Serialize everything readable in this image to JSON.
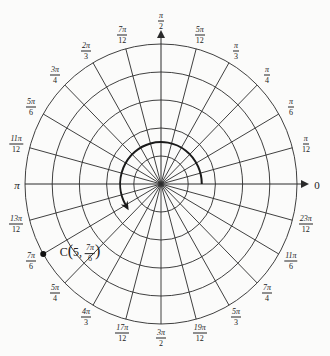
{
  "chart_data": {
    "type": "polar-grid",
    "title": "",
    "radial_circles": [
      1,
      2,
      3,
      4,
      5
    ],
    "angle_step": "π/12",
    "angle_labels": [
      {
        "angle_deg": 0,
        "num": "0",
        "den": ""
      },
      {
        "angle_deg": 15,
        "num": "π",
        "den": "12"
      },
      {
        "angle_deg": 30,
        "num": "π",
        "den": "6"
      },
      {
        "angle_deg": 45,
        "num": "π",
        "den": "4"
      },
      {
        "angle_deg": 60,
        "num": "π",
        "den": "3"
      },
      {
        "angle_deg": 75,
        "num": "5π",
        "den": "12"
      },
      {
        "angle_deg": 90,
        "num": "π",
        "den": "2"
      },
      {
        "angle_deg": 105,
        "num": "7π",
        "den": "12"
      },
      {
        "angle_deg": 120,
        "num": "2π",
        "den": "3"
      },
      {
        "angle_deg": 135,
        "num": "3π",
        "den": "4"
      },
      {
        "angle_deg": 150,
        "num": "5π",
        "den": "6"
      },
      {
        "angle_deg": 165,
        "num": "11π",
        "den": "12"
      },
      {
        "angle_deg": 180,
        "num": "π",
        "den": ""
      },
      {
        "angle_deg": 195,
        "num": "13π",
        "den": "12"
      },
      {
        "angle_deg": 210,
        "num": "7π",
        "den": "6"
      },
      {
        "angle_deg": 225,
        "num": "5π",
        "den": "4"
      },
      {
        "angle_deg": 240,
        "num": "4π",
        "den": "3"
      },
      {
        "angle_deg": 255,
        "num": "17π",
        "den": "12"
      },
      {
        "angle_deg": 270,
        "num": "3π",
        "den": "2"
      },
      {
        "angle_deg": 285,
        "num": "19π",
        "den": "12"
      },
      {
        "angle_deg": 300,
        "num": "5π",
        "den": "3"
      },
      {
        "angle_deg": 315,
        "num": "7π",
        "den": "4"
      },
      {
        "angle_deg": 330,
        "num": "11π",
        "den": "6"
      },
      {
        "angle_deg": 345,
        "num": "23π",
        "den": "12"
      }
    ],
    "points": [
      {
        "label": "C",
        "r": 5,
        "theta": "7π/6",
        "theta_deg": 210,
        "text_prefix": "C",
        "text_r": "5,",
        "text_theta_num": "7π",
        "text_theta_den": "6"
      }
    ],
    "arc": {
      "r": 1.5,
      "from_deg": 0,
      "to_deg": 210,
      "direction": "counterclockwise",
      "arrow": true
    }
  },
  "colors": {
    "line": "#2a2a2a",
    "background": "#fbfbfa"
  }
}
